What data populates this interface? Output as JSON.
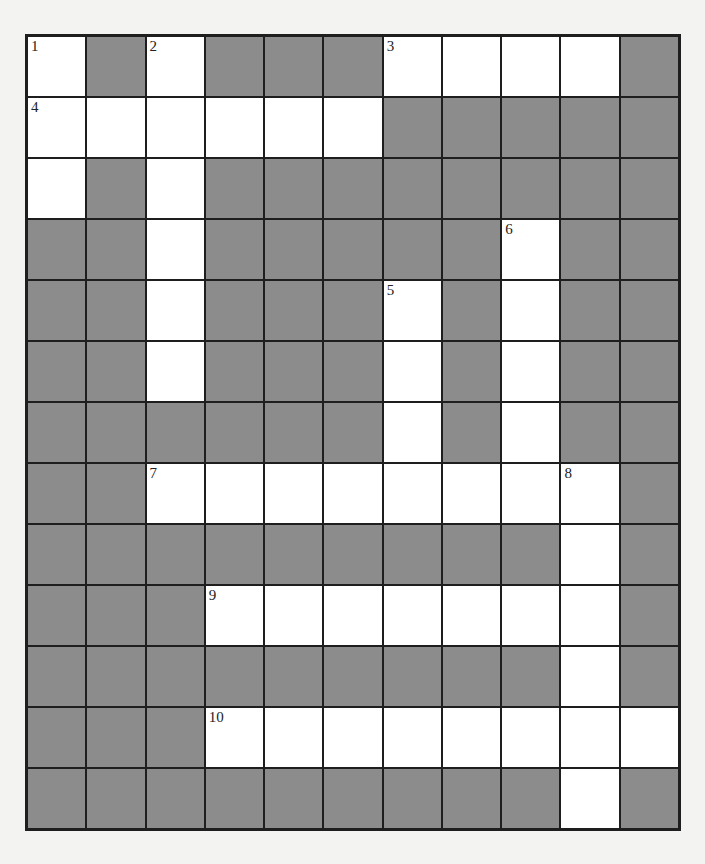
{
  "puzzle": {
    "type": "crossword",
    "columns": 11,
    "rows": 13,
    "colors": {
      "open": "#ffffff",
      "block": "#8c8c8c",
      "line": "#1e1e1e",
      "page": "#f3f3f1"
    },
    "grid": [
      [
        1,
        0,
        1,
        0,
        0,
        0,
        1,
        1,
        1,
        1,
        0
      ],
      [
        1,
        1,
        1,
        1,
        1,
        1,
        0,
        0,
        0,
        0,
        0
      ],
      [
        1,
        0,
        1,
        0,
        0,
        0,
        0,
        0,
        0,
        0,
        0
      ],
      [
        0,
        0,
        1,
        0,
        0,
        0,
        0,
        0,
        1,
        0,
        0
      ],
      [
        0,
        0,
        1,
        0,
        0,
        0,
        1,
        0,
        1,
        0,
        0
      ],
      [
        0,
        0,
        1,
        0,
        0,
        0,
        1,
        0,
        1,
        0,
        0
      ],
      [
        0,
        0,
        0,
        0,
        0,
        0,
        1,
        0,
        1,
        0,
        0
      ],
      [
        0,
        0,
        1,
        1,
        1,
        1,
        1,
        1,
        1,
        1,
        0
      ],
      [
        0,
        0,
        0,
        0,
        0,
        0,
        0,
        0,
        0,
        1,
        0
      ],
      [
        0,
        0,
        0,
        1,
        1,
        1,
        1,
        1,
        1,
        1,
        0
      ],
      [
        0,
        0,
        0,
        0,
        0,
        0,
        0,
        0,
        0,
        1,
        0
      ],
      [
        0,
        0,
        0,
        1,
        1,
        1,
        1,
        1,
        1,
        1,
        1
      ],
      [
        0,
        0,
        0,
        0,
        0,
        0,
        0,
        0,
        0,
        1,
        0
      ]
    ],
    "numbers": [
      {
        "row": 0,
        "col": 0,
        "n": "1"
      },
      {
        "row": 0,
        "col": 2,
        "n": "2"
      },
      {
        "row": 0,
        "col": 6,
        "n": "3"
      },
      {
        "row": 1,
        "col": 0,
        "n": "4"
      },
      {
        "row": 4,
        "col": 6,
        "n": "5"
      },
      {
        "row": 3,
        "col": 8,
        "n": "6"
      },
      {
        "row": 7,
        "col": 2,
        "n": "7"
      },
      {
        "row": 7,
        "col": 9,
        "n": "8"
      },
      {
        "row": 9,
        "col": 3,
        "n": "9"
      },
      {
        "row": 11,
        "col": 3,
        "n": "10"
      }
    ]
  }
}
